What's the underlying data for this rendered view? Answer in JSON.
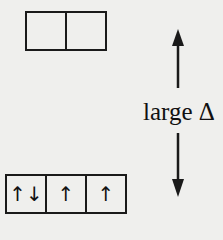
{
  "diagram": {
    "upper_orbitals": {
      "cells": [
        "",
        ""
      ]
    },
    "lower_orbitals": {
      "cells": [
        "↑↓",
        "↑",
        "↑"
      ]
    },
    "energy_gap_label": "large Δ",
    "arrow_icons": [
      "arrow-up-icon",
      "arrow-down-icon"
    ],
    "colors": {
      "line": "#1a1a1a",
      "background": "#efefed"
    }
  }
}
